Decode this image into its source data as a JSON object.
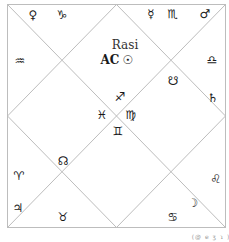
{
  "chart": {
    "title": "Rasi",
    "ascendant_label": "AC",
    "caption": "(@ e ʒ ɿ )",
    "line_color": "#bdbdbd",
    "houses": [
      {
        "pos": "top-left-top",
        "items": [
          {
            "name": "venus",
            "glyph": "♀"
          },
          {
            "name": "capricorn",
            "glyph": "♑"
          }
        ]
      },
      {
        "pos": "top-right-top",
        "items": [
          {
            "name": "mercury",
            "glyph": "☿"
          },
          {
            "name": "scorpio",
            "glyph": "♏"
          },
          {
            "name": "mars",
            "glyph": "♂"
          }
        ]
      },
      {
        "pos": "left-upper",
        "items": [
          {
            "name": "aquarius",
            "glyph": "♒"
          }
        ]
      },
      {
        "pos": "center-top",
        "items": [
          {
            "name": "sun",
            "glyph": "☉"
          }
        ]
      },
      {
        "pos": "right-upper",
        "items": [
          {
            "name": "libra",
            "glyph": "♎"
          },
          {
            "name": "saturn",
            "glyph": "♄"
          }
        ]
      },
      {
        "pos": "inner-upper-right",
        "items": [
          {
            "name": "ketu",
            "glyph": "☋"
          }
        ]
      },
      {
        "pos": "center",
        "items": [
          {
            "name": "sagittarius",
            "glyph": "♐"
          },
          {
            "name": "pisces",
            "glyph": "♓"
          },
          {
            "name": "virgo",
            "glyph": "♍"
          },
          {
            "name": "gemini",
            "glyph": "♊"
          }
        ]
      },
      {
        "pos": "inner-lower-left",
        "items": [
          {
            "name": "rahu",
            "glyph": "☊"
          }
        ]
      },
      {
        "pos": "left-lower",
        "items": [
          {
            "name": "aries",
            "glyph": "♈"
          },
          {
            "name": "jupiter",
            "glyph": "♃"
          }
        ]
      },
      {
        "pos": "bottom-left",
        "items": [
          {
            "name": "taurus",
            "glyph": "♉"
          }
        ]
      },
      {
        "pos": "right-lower",
        "items": [
          {
            "name": "leo",
            "glyph": "♌"
          }
        ]
      },
      {
        "pos": "bottom-right",
        "items": [
          {
            "name": "moon",
            "glyph": "☽"
          },
          {
            "name": "cancer",
            "glyph": "♋"
          }
        ]
      }
    ]
  }
}
